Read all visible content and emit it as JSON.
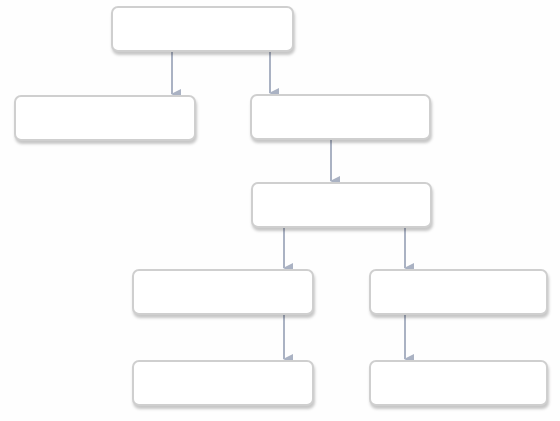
{
  "diagram": {
    "type": "flowchart",
    "colors": {
      "node_fill": "#ffffff",
      "node_border": "#cfcfcf",
      "arrow": "#aab2c3",
      "background": "#fefefe"
    },
    "nodes": [
      {
        "id": "n1",
        "label": "",
        "x": 111,
        "y": 6,
        "w": 183,
        "h": 46
      },
      {
        "id": "n2",
        "label": "",
        "x": 14,
        "y": 95,
        "w": 182,
        "h": 46
      },
      {
        "id": "n3",
        "label": "",
        "x": 250,
        "y": 94,
        "w": 181,
        "h": 46
      },
      {
        "id": "n4",
        "label": "",
        "x": 251,
        "y": 182,
        "w": 181,
        "h": 46
      },
      {
        "id": "n5",
        "label": "",
        "x": 132,
        "y": 269,
        "w": 182,
        "h": 46
      },
      {
        "id": "n6",
        "label": "",
        "x": 369,
        "y": 269,
        "w": 179,
        "h": 46
      },
      {
        "id": "n7",
        "label": "",
        "x": 132,
        "y": 360,
        "w": 182,
        "h": 46
      },
      {
        "id": "n8",
        "label": "",
        "x": 369,
        "y": 360,
        "w": 179,
        "h": 46
      }
    ],
    "edges": [
      {
        "from": "n1",
        "to": "n2",
        "x": 172,
        "y1": 52,
        "y2": 94
      },
      {
        "from": "n1",
        "to": "n3",
        "x": 270,
        "y1": 52,
        "y2": 93
      },
      {
        "from": "n3",
        "to": "n4",
        "x": 331,
        "y1": 140,
        "y2": 181
      },
      {
        "from": "n4",
        "to": "n5",
        "x": 284,
        "y1": 228,
        "y2": 268
      },
      {
        "from": "n4",
        "to": "n6",
        "x": 405,
        "y1": 228,
        "y2": 268
      },
      {
        "from": "n5",
        "to": "n7",
        "x": 284,
        "y1": 315,
        "y2": 359
      },
      {
        "from": "n6",
        "to": "n8",
        "x": 405,
        "y1": 315,
        "y2": 359
      }
    ]
  }
}
